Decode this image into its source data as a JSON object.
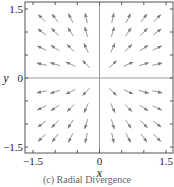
{
  "chart_data": {
    "type": "quiver",
    "title": "",
    "field": "F(x, y) = (x, y)",
    "xlabel": "x",
    "ylabel": "y",
    "xlim": [
      -1.5,
      1.5
    ],
    "ylim": [
      -1.5,
      1.5
    ],
    "xticks": [
      -1.5,
      0,
      1.5
    ],
    "yticks": [
      -1.5,
      0,
      1.5
    ],
    "xtick_labels": [
      "−1.5",
      "0",
      "1.5"
    ],
    "ytick_labels": [
      "−1.5",
      "0",
      "1.5"
    ],
    "minor_ticks": [
      -1.0,
      -0.5,
      0.5,
      1.0
    ],
    "grid_samples": [
      -1.3,
      -1.0,
      -0.65,
      -0.3,
      0.3,
      0.65,
      1.0,
      1.3
    ],
    "grid": false,
    "axes_lines_through_origin": true,
    "arrow_color": "#8a8a8a",
    "frame_color": "#555555"
  },
  "caption": "(c)  Radial Divergence"
}
